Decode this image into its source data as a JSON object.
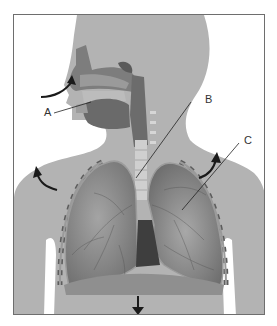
{
  "diagram": {
    "labels": [
      {
        "id": "A",
        "text": "A"
      },
      {
        "id": "B",
        "text": "B"
      },
      {
        "id": "C",
        "text": "C"
      }
    ],
    "arrows": [
      {
        "name": "inhale-air-arrow",
        "direction": "into nose"
      },
      {
        "name": "ribcage-left-arrow",
        "direction": "up-outward"
      },
      {
        "name": "ribcage-right-arrow",
        "direction": "up-outward"
      },
      {
        "name": "diaphragm-arrow",
        "direction": "down"
      }
    ],
    "colors": {
      "body": "#b3b3b3",
      "lung": "#8a8a8a",
      "lung_dark": "#5e5e5e",
      "trachea": "#d0d0d0",
      "frame": "#6e6e6e",
      "arrow": "#1a1a1a"
    }
  }
}
